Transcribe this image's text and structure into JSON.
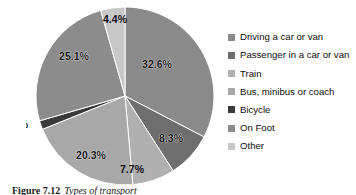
{
  "figure": {
    "caption_number": "Figure 7.12",
    "caption_text": "Types of transport"
  },
  "chart_data": {
    "type": "pie",
    "title": "",
    "xlabel": "",
    "ylabel": "",
    "legend_position": "right",
    "grid": false,
    "start_angle_deg": 0,
    "direction": "clockwise",
    "units": "percent",
    "total": 100.0,
    "categories": [
      "Driving a car or van",
      "Passenger in a car or van",
      "Train",
      "Bus, minibus or coach",
      "Bicycle",
      "On Foot",
      "Other"
    ],
    "values": [
      32.6,
      8.3,
      7.7,
      20.3,
      1.6,
      25.1,
      4.4
    ],
    "data_labels": [
      "32.6%",
      "8.3%",
      "7.7%",
      "20.3%",
      "1.6%",
      "25.1%",
      "4.4%"
    ],
    "colors": [
      "#8a8a8a",
      "#6e6e6e",
      "#b0b0b0",
      "#a8a8a8",
      "#3a3a3a",
      "#8c8c8c",
      "#c8c8c8"
    ],
    "slices": [
      {
        "label": "Driving a car or van",
        "value": 32.6,
        "display": "32.6%",
        "color": "#8a8a8a",
        "label_x": 131,
        "label_y": 61,
        "outside": false
      },
      {
        "label": "Passenger in a car or van",
        "value": 8.3,
        "display": "8.3%",
        "color": "#6e6e6e",
        "label_x": 145,
        "label_y": 135,
        "outside": false
      },
      {
        "label": "Train",
        "value": 7.7,
        "display": "7.7%",
        "color": "#b0b0b0",
        "label_x": 106,
        "label_y": 166,
        "outside": true
      },
      {
        "label": "Bus, minibus or coach",
        "value": 20.3,
        "display": "20.3%",
        "color": "#a8a8a8",
        "label_x": 65,
        "label_y": 152,
        "outside": false
      },
      {
        "label": "Bicycle",
        "value": 1.6,
        "display": "1.6%",
        "color": "#3a3a3a",
        "label_x": -10,
        "label_y": 121,
        "outside": true
      },
      {
        "label": "On Foot",
        "value": 25.1,
        "display": "25.1%",
        "color": "#8c8c8c",
        "label_x": 48,
        "label_y": 53,
        "outside": false
      },
      {
        "label": "Other",
        "value": 4.4,
        "display": "4.4%",
        "color": "#c8c8c8",
        "label_x": 89,
        "label_y": 16,
        "outside": true
      }
    ]
  },
  "legend": {
    "items": [
      {
        "label": "Driving a car or van",
        "color": "#8a8a8a"
      },
      {
        "label": "Passenger in a car or van",
        "color": "#6e6e6e"
      },
      {
        "label": "Train",
        "color": "#b0b0b0"
      },
      {
        "label": "Bus, minibus or coach",
        "color": "#a8a8a8"
      },
      {
        "label": "Bicycle",
        "color": "#3a3a3a"
      },
      {
        "label": "On Foot",
        "color": "#8c8c8c"
      },
      {
        "label": "Other",
        "color": "#c8c8c8"
      }
    ]
  }
}
